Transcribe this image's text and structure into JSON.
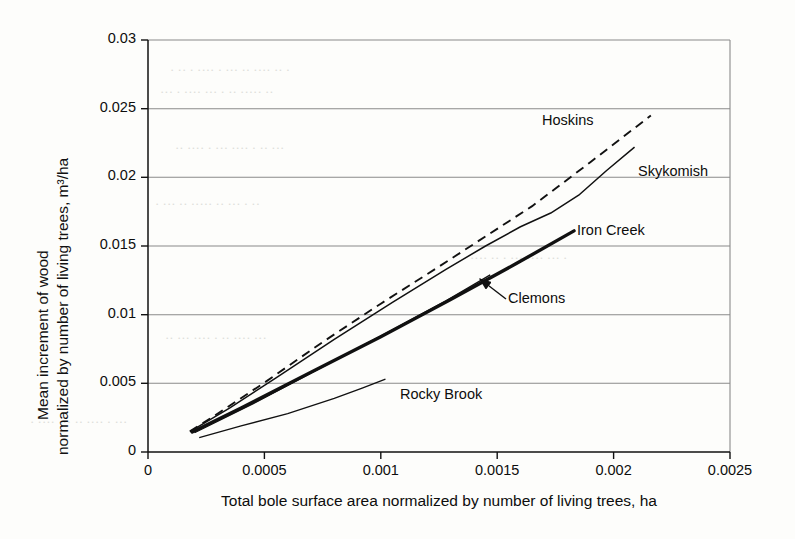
{
  "figure": {
    "background_color": "#fdfdfb",
    "ink_color": "#111111",
    "grid_color": "#8a8a8a"
  },
  "axes": {
    "x_title": "Total bole surface area normalized by number of living trees, ha",
    "y_title_line1": "Mean increment of wood",
    "y_title_line2": "normalized by number of living trees, m³/ha",
    "x_ticks": [
      "0",
      "0.0005",
      "0.001",
      "0.0015",
      "0.002",
      "0.0025"
    ],
    "y_ticks": [
      "0",
      "0.005",
      "0.01",
      "0.015",
      "0.02",
      "0.025",
      "0.03"
    ]
  },
  "annotations": {
    "hoskins_label": "Hoskins",
    "skykomish_label": "Skykomish",
    "iron_creek_label": "Iron Creek",
    "clemons_label": "Clemons",
    "rocky_brook_label": "Rocky Brook"
  },
  "bleed_text": [
    "· ·· · ···· · ··· ·· ···· ·· ·",
    "··· · ···· ··· · ·· ····· ··",
    "·· ···· · ··· ···· · ·· ···",
    "· ··· ·· ····· ·· ··· · ··",
    "···· ·· · ··· ···· ··· ·",
    "·· ··· ···· · ·· ···· ···",
    "· ···· ··· ·· ···· · ···"
  ],
  "chart_data": {
    "type": "line",
    "title": "",
    "xlabel": "Total bole surface area normalized by number of living trees, ha",
    "ylabel": "Mean increment of wood normalized by number of living trees, m³/ha",
    "xlim": [
      0,
      0.0025
    ],
    "ylim": [
      0,
      0.03
    ],
    "xticks": [
      0,
      0.0005,
      0.001,
      0.0015,
      0.002,
      0.0025
    ],
    "yticks": [
      0,
      0.005,
      0.01,
      0.015,
      0.02,
      0.025,
      0.03
    ],
    "grid": "horizontal",
    "legend": "inline-annotations",
    "series": [
      {
        "name": "Hoskins",
        "style": "dashed",
        "width": 1.8,
        "points": [
          [
            0.00018,
            0.0015
          ],
          [
            0.0003,
            0.0028
          ],
          [
            0.0005,
            0.00505
          ],
          [
            0.00075,
            0.008
          ],
          [
            0.001,
            0.0108
          ],
          [
            0.00125,
            0.0135
          ],
          [
            0.00145,
            0.0157
          ],
          [
            0.00165,
            0.0179
          ],
          [
            0.0019,
            0.0211
          ],
          [
            0.00216,
            0.0245
          ]
        ]
      },
      {
        "name": "Skykomish",
        "style": "solid",
        "width": 1.4,
        "points": [
          [
            0.00018,
            0.00148
          ],
          [
            0.00035,
            0.0032
          ],
          [
            0.00055,
            0.0054
          ],
          [
            0.0008,
            0.0082
          ],
          [
            0.00105,
            0.0109
          ],
          [
            0.00128,
            0.0133
          ],
          [
            0.00145,
            0.015
          ],
          [
            0.0016,
            0.0164
          ],
          [
            0.00173,
            0.0174
          ],
          [
            0.00185,
            0.0187
          ],
          [
            0.00197,
            0.0205
          ],
          [
            0.00209,
            0.0222
          ]
        ]
      },
      {
        "name": "Iron Creek",
        "style": "solid-thick",
        "width": 3.2,
        "points": [
          [
            0.00019,
            0.00145
          ],
          [
            0.0004,
            0.0032
          ],
          [
            0.0007,
            0.0058
          ],
          [
            0.001,
            0.0084
          ],
          [
            0.0013,
            0.0111
          ],
          [
            0.00158,
            0.0137
          ],
          [
            0.00183,
            0.0161
          ]
        ]
      },
      {
        "name": "Clemons",
        "style": "solid-thin",
        "width": 1.2,
        "points": [
          [
            0.0002,
            0.0014
          ],
          [
            0.00045,
            0.0035
          ],
          [
            0.00075,
            0.0062
          ],
          [
            0.00105,
            0.0089
          ],
          [
            0.00128,
            0.011
          ],
          [
            0.00147,
            0.0129
          ]
        ]
      },
      {
        "name": "Rocky Brook",
        "style": "solid-thin",
        "width": 1.2,
        "points": [
          [
            0.00022,
            0.00105
          ],
          [
            0.0004,
            0.0019
          ],
          [
            0.0006,
            0.0028
          ],
          [
            0.0008,
            0.0039
          ],
          [
            0.00092,
            0.00465
          ],
          [
            0.00102,
            0.0053
          ]
        ]
      }
    ]
  }
}
